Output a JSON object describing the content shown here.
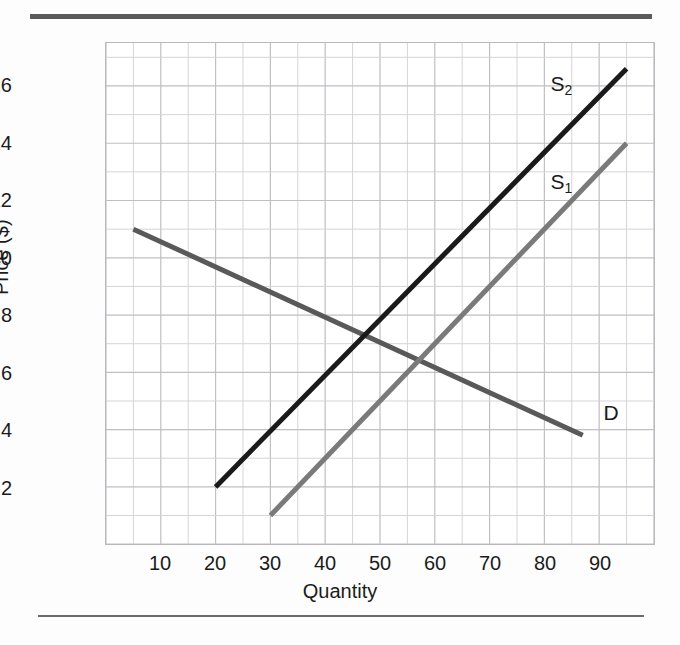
{
  "chart_data": {
    "type": "line",
    "title": "",
    "xlabel": "Quantity",
    "ylabel": "Price ($)",
    "xlim": [
      0,
      100
    ],
    "ylim": [
      0,
      17.5
    ],
    "xticks": [
      10,
      20,
      30,
      40,
      50,
      60,
      70,
      80,
      90
    ],
    "yticks": [
      2,
      4,
      6,
      8,
      10,
      12,
      14,
      16
    ],
    "grid": true,
    "grid_x_step": 5,
    "grid_y_step": 1,
    "legend_position": "inline-annotations",
    "series": [
      {
        "name": "D",
        "label": "D",
        "role": "demand",
        "color": "#595959",
        "width": 5,
        "points": [
          [
            5,
            11.0
          ],
          [
            87,
            3.8
          ]
        ],
        "annotation": {
          "text": "D",
          "x": 92,
          "y": 4.6
        }
      },
      {
        "name": "S1",
        "label": "S₁",
        "role": "supply-original",
        "color": "#7a7a7a",
        "width": 5,
        "points": [
          [
            30,
            1.0
          ],
          [
            95,
            14.0
          ]
        ],
        "annotation": {
          "text": "S",
          "sub": "1",
          "x": 83,
          "y": 12.6
        }
      },
      {
        "name": "S2",
        "label": "S₂",
        "role": "supply-shifted",
        "color": "#1a1a1a",
        "width": 5,
        "points": [
          [
            20,
            2.0
          ],
          [
            95,
            16.6
          ]
        ],
        "annotation": {
          "text": "S",
          "sub": "2",
          "x": 83,
          "y": 16.0
        }
      }
    ],
    "intersections": [
      {
        "series": [
          "D",
          "S2"
        ],
        "x": 46,
        "y": 7.3
      },
      {
        "series": [
          "D",
          "S1"
        ],
        "x": 56,
        "y": 6.4
      }
    ]
  },
  "style": {
    "grid_color": "#d5d5d8",
    "grid_major_color": "#bfbfc4",
    "plot_border_color": "#b9b9bd",
    "rule_color": "#5a5a5a",
    "text_color": "#1b1b1b",
    "background": "#fdfdfd"
  },
  "axis": {
    "x_title": "Quantity",
    "y_title": "Price ($)"
  }
}
